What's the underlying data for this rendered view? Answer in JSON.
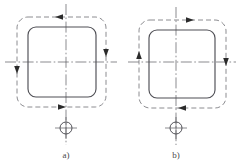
{
  "figure": {
    "type": "engineering-drawing",
    "width": 242,
    "height": 167,
    "background_color": "#ffffff",
    "colors": {
      "solid_outline": "#4f4f55",
      "dashed_path": "#6e6e74",
      "centerline": "#5a5a60",
      "arrow": "#2b2b2b",
      "text": "#4a4a4a"
    },
    "panels": [
      {
        "id": "a",
        "label": "a)",
        "direction": "counterclockwise",
        "center_x": 66,
        "center_y": 62,
        "solid_rect": {
          "x": 28,
          "y": 27,
          "width": 68,
          "height": 70,
          "corner_radius": 8
        },
        "dashed_rect": {
          "x": 17,
          "y": 17,
          "width": 89,
          "height": 90,
          "corner_radius": 11
        },
        "arrows": [
          {
            "name": "top-arrow",
            "edge": "top",
            "points": "left",
            "x": 59,
            "y": 17
          },
          {
            "name": "right-arrow",
            "edge": "right",
            "points": "down",
            "x": 106,
            "y": 53
          },
          {
            "name": "bottom-arrow",
            "edge": "bottom",
            "points": "right",
            "x": 62,
            "y": 107
          },
          {
            "name": "left-arrow",
            "edge": "left",
            "points": "down",
            "x": 17,
            "y": 70
          }
        ],
        "datum_marker": {
          "cx": 66,
          "cy": 128,
          "r": 6
        },
        "vertical_centerline": {
          "x": 66,
          "y1": 4,
          "y2": 145
        },
        "horizontal_centerline": {
          "y": 62,
          "x1": 5,
          "x2": 117
        }
      },
      {
        "id": "b",
        "label": "b)",
        "direction": "clockwise",
        "center_x": 176,
        "center_y": 62,
        "solid_rect": {
          "x": 149,
          "y": 30,
          "width": 66,
          "height": 68,
          "corner_radius": 8
        },
        "dashed_rect": {
          "x": 139,
          "y": 20,
          "width": 87,
          "height": 88,
          "corner_radius": 11
        },
        "arrows": [
          {
            "name": "top-arrow",
            "edge": "top",
            "points": "right",
            "x": 190,
            "y": 20
          },
          {
            "name": "right-arrow",
            "edge": "right",
            "points": "down",
            "x": 226,
            "y": 62
          },
          {
            "name": "bottom-arrow",
            "edge": "bottom",
            "points": "left",
            "x": 182,
            "y": 108
          },
          {
            "name": "left-arrow",
            "edge": "left",
            "points": "up",
            "x": 139,
            "y": 55
          }
        ],
        "datum_marker": {
          "cx": 176,
          "cy": 128,
          "r": 6
        },
        "vertical_centerline": {
          "x": 176,
          "y1": 7,
          "y2": 145
        },
        "horizontal_centerline": {
          "y": 62,
          "x1": 128,
          "x2": 236
        }
      }
    ],
    "captions": [
      {
        "name": "caption-a",
        "text": "a)",
        "x": 66,
        "y": 155
      },
      {
        "name": "caption-b",
        "text": "b)",
        "x": 176,
        "y": 155
      }
    ]
  }
}
